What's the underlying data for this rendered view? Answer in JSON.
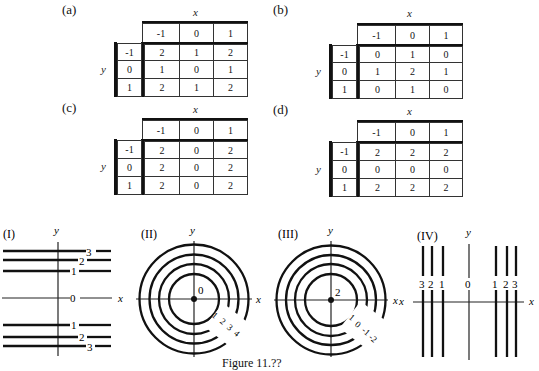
{
  "tables": [
    {
      "label": "(a)",
      "x_label": "x",
      "y_label": "y",
      "x_headers": [
        "-1",
        "0",
        "1"
      ],
      "y_headers": [
        "-1",
        "0",
        "1"
      ],
      "rows": [
        [
          "2",
          "1",
          "2"
        ],
        [
          "1",
          "0",
          "1"
        ],
        [
          "2",
          "1",
          "2"
        ]
      ]
    },
    {
      "label": "(b)",
      "x_label": "x",
      "y_label": "y",
      "x_headers": [
        "-1",
        "0",
        "1"
      ],
      "y_headers": [
        "-1",
        "0",
        "1"
      ],
      "rows": [
        [
          "0",
          "1",
          "0"
        ],
        [
          "1",
          "2",
          "1"
        ],
        [
          "0",
          "1",
          "0"
        ]
      ]
    },
    {
      "label": "(c)",
      "x_label": "x",
      "y_label": "y",
      "x_headers": [
        "-1",
        "0",
        "1"
      ],
      "y_headers": [
        "-1",
        "0",
        "1"
      ],
      "rows": [
        [
          "2",
          "0",
          "2"
        ],
        [
          "2",
          "0",
          "2"
        ],
        [
          "2",
          "0",
          "2"
        ]
      ]
    },
    {
      "label": "(d)",
      "x_label": "x",
      "y_label": "y",
      "x_headers": [
        "-1",
        "0",
        "1"
      ],
      "y_headers": [
        "-1",
        "0",
        "1"
      ],
      "rows": [
        [
          "2",
          "2",
          "2"
        ],
        [
          "0",
          "0",
          "0"
        ],
        [
          "2",
          "2",
          "2"
        ]
      ]
    }
  ],
  "contour_plots": [
    {
      "label": "(I)",
      "type": "horizontal-lines",
      "x_label": "x",
      "y_label": "y",
      "center_label": "0",
      "upper_labels": [
        "1",
        "2",
        "3"
      ],
      "lower_labels": [
        "1",
        "2",
        "3"
      ]
    },
    {
      "label": "(II)",
      "type": "concentric-circles",
      "x_label": "x",
      "y_label": "y",
      "center_label": "0",
      "ring_labels": [
        "1",
        "2",
        "3",
        "4"
      ]
    },
    {
      "label": "(III)",
      "type": "concentric-circles",
      "x_label": "x",
      "y_label": "y",
      "center_label": "2",
      "ring_labels": [
        "1",
        "0",
        "-1",
        "-2"
      ]
    },
    {
      "label": "(IV)",
      "type": "vertical-lines",
      "x_label": "x",
      "y_label": "y",
      "center_label": "0",
      "left_labels": [
        "3",
        "2",
        "1"
      ],
      "right_labels": [
        "1",
        "2",
        "3"
      ]
    }
  ],
  "caption": "Figure 11.??"
}
